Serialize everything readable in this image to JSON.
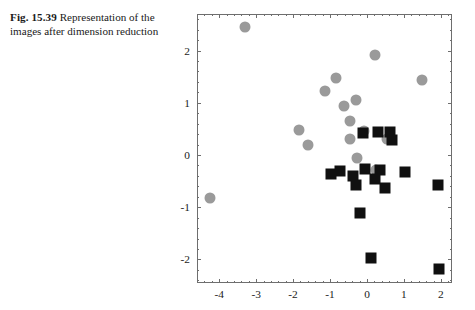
{
  "caption": {
    "label": "Fig. 15.39",
    "text": "Representation of the images after dimension reduction"
  },
  "chart_data": {
    "type": "scatter",
    "title": "",
    "xlabel": "",
    "ylabel": "",
    "xlim": [
      -4.6,
      2.3
    ],
    "ylim": [
      -2.45,
      2.7
    ],
    "xticks": [
      -4,
      -3,
      -2,
      -1,
      0,
      1,
      2
    ],
    "yticks": [
      -2,
      -1,
      0,
      1,
      2
    ],
    "xticklabels": [
      "-4",
      "-3",
      "-2",
      "-1",
      "0",
      "1",
      "2"
    ],
    "yticklabels": [
      "-2",
      "-1",
      "0",
      "1",
      "2"
    ],
    "grid": false,
    "legend": "none",
    "colors": {
      "circle": "#9a9a9a",
      "square": "#101010",
      "frame": "#6e6e6e"
    },
    "series": [
      {
        "name": "Class A",
        "marker": "circle",
        "color": "#9a9a9a",
        "points": [
          [
            -3.3,
            2.45
          ],
          [
            -4.25,
            -0.83
          ],
          [
            -1.85,
            0.47
          ],
          [
            -1.6,
            0.2
          ],
          [
            -1.15,
            1.22
          ],
          [
            -0.85,
            1.47
          ],
          [
            -0.62,
            0.93
          ],
          [
            -0.47,
            0.66
          ],
          [
            -0.45,
            0.3
          ],
          [
            -0.3,
            1.05
          ],
          [
            -0.28,
            -0.06
          ],
          [
            -0.08,
            0.46
          ],
          [
            0.22,
            1.92
          ],
          [
            0.25,
            -0.28
          ],
          [
            0.55,
            0.3
          ],
          [
            1.5,
            1.43
          ]
        ]
      },
      {
        "name": "Class B",
        "marker": "square",
        "color": "#101010",
        "points": [
          [
            -0.12,
            0.42
          ],
          [
            0.3,
            0.45
          ],
          [
            0.62,
            0.44
          ],
          [
            0.68,
            0.28
          ],
          [
            -0.98,
            -0.36
          ],
          [
            -0.72,
            -0.31
          ],
          [
            -0.38,
            -0.4
          ],
          [
            -0.3,
            -0.57
          ],
          [
            -0.06,
            -0.26
          ],
          [
            0.22,
            -0.46
          ],
          [
            0.36,
            -0.28
          ],
          [
            0.48,
            -0.63
          ],
          [
            1.02,
            -0.33
          ],
          [
            1.92,
            -0.57
          ],
          [
            -0.18,
            -1.11
          ],
          [
            0.1,
            -1.98
          ],
          [
            1.95,
            -2.18
          ]
        ]
      }
    ]
  }
}
